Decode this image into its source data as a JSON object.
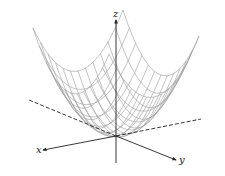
{
  "figure": {
    "type": "3d-surface-wireframe",
    "surface": "paraboloid z = x^2 + y^2",
    "axes": {
      "x": {
        "label": "x"
      },
      "y": {
        "label": "y"
      },
      "z": {
        "label": "z"
      }
    },
    "colors": {
      "mesh": "#9a9a9a",
      "axis": "#222222",
      "background": "#ffffff"
    },
    "mesh": {
      "u_range": [
        -1,
        1
      ],
      "v_range": [
        -1,
        1
      ],
      "divisions": 12,
      "samples": 24
    },
    "projection": {
      "origin": [
        116,
        136
      ],
      "x_dir": [
        -45,
        9
      ],
      "y_dir": [
        38,
        13
      ],
      "z_scale": 52
    },
    "axis_geometry": {
      "z_axis": {
        "from": [
          116,
          163
        ],
        "to": [
          116,
          20
        ]
      },
      "x_axis_front": {
        "from": [
          116,
          136
        ],
        "to": [
          43,
          150
        ]
      },
      "x_axis_back": {
        "from": [
          116,
          136
        ],
        "to": [
          29,
          100
        ]
      },
      "y_axis_front": {
        "from": [
          116,
          136
        ],
        "to": [
          176,
          160
        ]
      },
      "y_axis_back": {
        "from": [
          116,
          136
        ],
        "to": [
          201,
          119
        ]
      },
      "x_label_pos": [
        36,
        153
      ],
      "y_label_pos": [
        179,
        163
      ],
      "z_label_pos": [
        113,
        17
      ]
    }
  }
}
